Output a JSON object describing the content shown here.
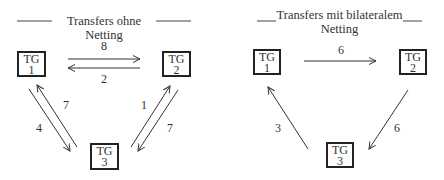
{
  "left": {
    "title": "Transfers ohne Netting",
    "nodes": [
      {
        "id": "TG1",
        "line1": "TG",
        "line2": "1"
      },
      {
        "id": "TG2",
        "line1": "TG",
        "line2": "2"
      },
      {
        "id": "TG3",
        "line1": "TG",
        "line2": "3"
      }
    ],
    "edges": [
      {
        "from": "TG1",
        "to": "TG2",
        "value": "8"
      },
      {
        "from": "TG2",
        "to": "TG1",
        "value": "2"
      },
      {
        "from": "TG1",
        "to": "TG3",
        "value": "4"
      },
      {
        "from": "TG3",
        "to": "TG1",
        "value": "7"
      },
      {
        "from": "TG3",
        "to": "TG2",
        "value": "1"
      },
      {
        "from": "TG2",
        "to": "TG3",
        "value": "7"
      }
    ]
  },
  "right": {
    "title_line1": "Transfers mit bilateralem",
    "title_line2": "Netting",
    "nodes": [
      {
        "id": "TG1",
        "line1": "TG",
        "line2": "1"
      },
      {
        "id": "TG2",
        "line1": "TG",
        "line2": "2"
      },
      {
        "id": "TG3",
        "line1": "TG",
        "line2": "3"
      }
    ],
    "edges": [
      {
        "from": "TG1",
        "to": "TG2",
        "value": "6"
      },
      {
        "from": "TG2",
        "to": "TG3",
        "value": "6"
      },
      {
        "from": "TG3",
        "to": "TG1",
        "value": "3"
      }
    ]
  }
}
